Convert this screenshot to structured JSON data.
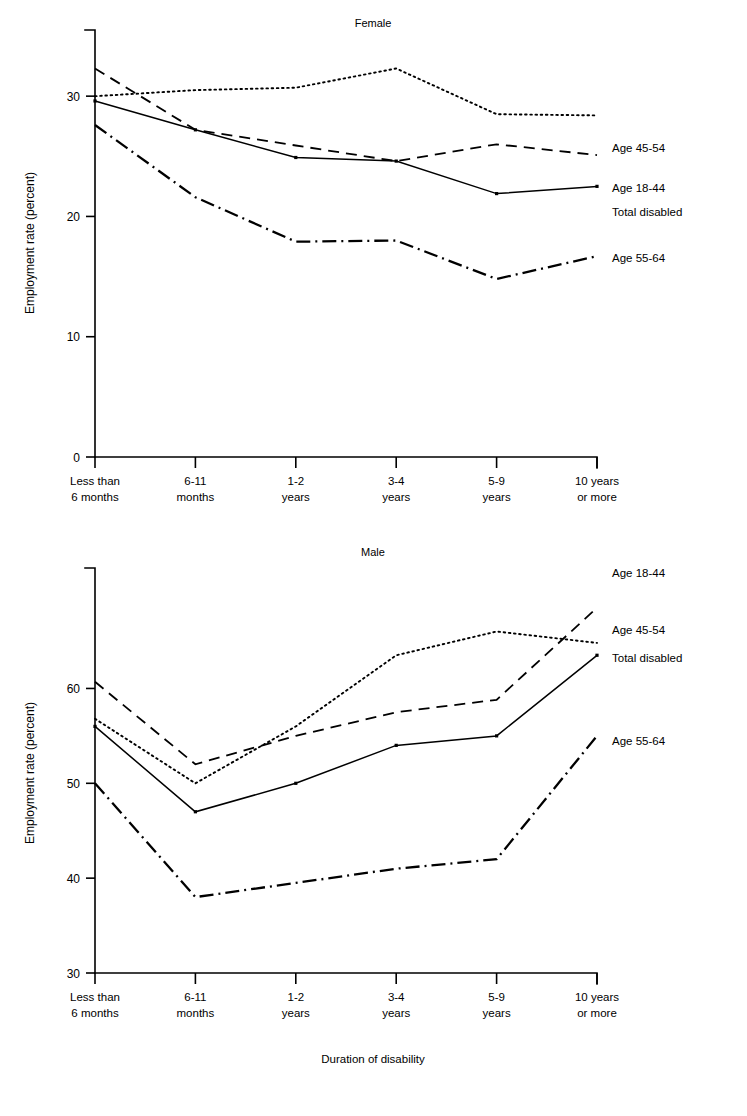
{
  "figure": {
    "xaxis_title": "Duration of disability",
    "yaxis_title": "Employment rate (percent)",
    "categories": [
      [
        "Less than",
        "6 months"
      ],
      [
        "6-11",
        "months"
      ],
      [
        "1-2",
        "years"
      ],
      [
        "3-4",
        "years"
      ],
      [
        "5-9",
        "years"
      ],
      [
        "10 years",
        "or more"
      ]
    ],
    "line_color": "#000000",
    "background": "#ffffff"
  },
  "panels": [
    {
      "id": "female",
      "title": "Female"
    },
    {
      "id": "male",
      "title": "Male"
    }
  ],
  "chart_data": [
    {
      "type": "line",
      "title": "Female",
      "xlabel": "Duration of disability",
      "ylabel": "Employment rate (percent)",
      "categories": [
        "Less than 6 months",
        "6-11 months",
        "1-2 years",
        "3-4 years",
        "5-9 years",
        "10 years or more"
      ],
      "ylim": [
        0,
        35
      ],
      "yticks": [
        0,
        10,
        20,
        30
      ],
      "ytick_labels": [
        "0",
        "10",
        "20",
        "30"
      ],
      "grid": false,
      "legend_position": "right-inline-labels",
      "series": [
        {
          "name": "Age 45-54",
          "style": "dotted",
          "values": [
            30.0,
            30.5,
            30.7,
            32.3,
            28.5,
            28.4
          ]
        },
        {
          "name": "Age 18-44",
          "style": "dashed",
          "values": [
            32.3,
            27.2,
            25.9,
            24.6,
            26.0,
            25.1
          ]
        },
        {
          "name": "Total disabled",
          "style": "solid",
          "values": [
            29.6,
            27.2,
            24.9,
            24.6,
            21.9,
            22.5
          ]
        },
        {
          "name": "Age 55-64",
          "style": "dash-dot",
          "values": [
            27.6,
            21.6,
            17.9,
            18.0,
            14.8,
            16.7
          ]
        }
      ]
    },
    {
      "type": "line",
      "title": "Male",
      "xlabel": "Duration of disability",
      "ylabel": "Employment rate (percent)",
      "categories": [
        "Less than 6 months",
        "6-11 months",
        "1-2 years",
        "3-4 years",
        "5-9 years",
        "10 years or more"
      ],
      "ylim": [
        30,
        70
      ],
      "yticks": [
        30,
        40,
        50,
        60
      ],
      "ytick_labels": [
        "30",
        "40",
        "50",
        "60"
      ],
      "grid": false,
      "legend_position": "right-inline-labels",
      "series": [
        {
          "name": "Age 18-44",
          "style": "dashed",
          "values": [
            60.7,
            52.0,
            55.0,
            57.5,
            58.8,
            68.5
          ]
        },
        {
          "name": "Age 45-54",
          "style": "dotted",
          "values": [
            56.8,
            50.0,
            56.0,
            63.5,
            66.0,
            64.8
          ]
        },
        {
          "name": "Total disabled",
          "style": "solid",
          "values": [
            56.0,
            47.0,
            50.0,
            54.0,
            55.0,
            63.5
          ]
        },
        {
          "name": "Age 55-64",
          "style": "dash-dot",
          "values": [
            50.0,
            38.0,
            39.5,
            41.0,
            42.0,
            55.0
          ]
        }
      ]
    }
  ]
}
